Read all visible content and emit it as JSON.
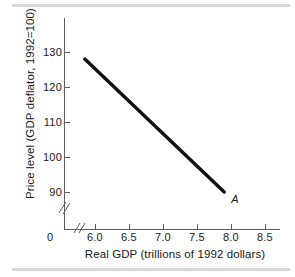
{
  "figure": {
    "background_color": "#ffffff",
    "rule_color": "#d8d8d8",
    "axis_color": "#5d5d5d",
    "curve_color": "#111111"
  },
  "chart_data": {
    "type": "line",
    "title": "",
    "subtitle": "",
    "xlabel": "Real GDP (trillions of 1992 dollars)",
    "ylabel": "Price level (GDP deflator, 1992=100)",
    "xlim": [
      5.75,
      8.75
    ],
    "ylim": [
      85,
      135
    ],
    "grid": false,
    "legend": null,
    "x_ticks": [
      "6.0",
      "6.5",
      "7.0",
      "7.5",
      "8.0",
      "8.5"
    ],
    "x_tick_values": [
      6.0,
      6.5,
      7.0,
      7.5,
      8.0,
      8.5
    ],
    "y_ticks": [
      "130",
      "120",
      "110",
      "100",
      "90"
    ],
    "y_tick_values": [
      130,
      120,
      110,
      100,
      90
    ],
    "origin_label": "0",
    "x_axis_break": true,
    "y_axis_break": true,
    "series": [
      {
        "name": "Aggregate demand",
        "x": [
          5.85,
          7.9
        ],
        "values": [
          128,
          90
        ]
      }
    ],
    "annotations": [
      {
        "text": "A",
        "x": 7.9,
        "y": 90,
        "style": "italic",
        "position": "below-right"
      }
    ]
  }
}
